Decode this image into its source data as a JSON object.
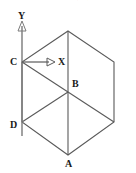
{
  "figure": {
    "caption_top_cutoff": "如图所示的正六边形是一个正方体的直观图",
    "canvas": {
      "width": 136,
      "height": 173
    },
    "background_color": "#ffffff",
    "stroke_color": "#555555",
    "label_color": "#1a1a1a",
    "shape": {
      "type": "regular-hexagon-cube-projection",
      "vertices": [
        {
          "name": "top",
          "x": 68,
          "y": 31
        },
        {
          "name": "upper-right",
          "x": 114,
          "y": 62
        },
        {
          "name": "lower-right",
          "x": 114,
          "y": 122
        },
        {
          "name": "A",
          "x": 68,
          "y": 155
        },
        {
          "name": "D",
          "x": 22,
          "y": 122
        },
        {
          "name": "C",
          "x": 22,
          "y": 62
        }
      ],
      "center": {
        "name": "B",
        "x": 68,
        "y": 92
      },
      "inner_edges": [
        {
          "from": "B",
          "to": "top"
        },
        {
          "from": "B",
          "to": "C"
        },
        {
          "from": "B",
          "to": "D"
        },
        {
          "from": "B",
          "to": "A"
        },
        {
          "from": "B",
          "to": "lower-right"
        }
      ]
    },
    "axes": {
      "y_axis": {
        "label": "Y",
        "label_x": 18,
        "label_y": 12,
        "line_x": 22,
        "line_top": 22,
        "line_bottom": 136,
        "arrow_direction": "up"
      },
      "x_axis": {
        "label": "X",
        "label_x": 58,
        "label_y": 57,
        "line_y": 62,
        "line_left": 22,
        "line_right": 55,
        "arrow_direction": "right"
      },
      "origin_vertex": "C"
    },
    "point_labels": [
      {
        "text": "C",
        "x": 11,
        "y": 57
      },
      {
        "text": "X",
        "x": 58,
        "y": 57
      },
      {
        "text": "B",
        "x": 72,
        "y": 79
      },
      {
        "text": "D",
        "x": 11,
        "y": 120
      },
      {
        "text": "A",
        "x": 65,
        "y": 159
      },
      {
        "text": "Y",
        "x": 18,
        "y": 12
      }
    ]
  }
}
